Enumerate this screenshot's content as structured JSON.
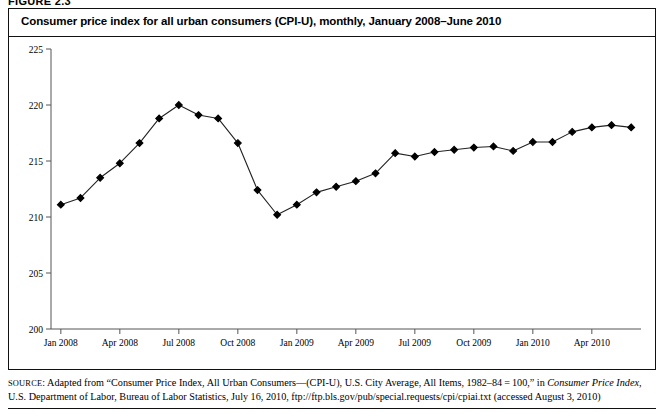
{
  "figure": {
    "label": "FIGURE 2.3"
  },
  "title": "Consumer price index for all urban consumers (CPI-U), monthly, January 2008–June 2010",
  "source": {
    "prefix": "SOURCE",
    "line1_a": ": Adapted from “Consumer Price Index, All Urban Consumers—(CPI-U), U.S. City Average, All Items, 1982–84 = 100,” in ",
    "line1_em": "Consumer Price Index,",
    "line2": "U.S. Department of Labor, Bureau of Labor Statistics, July 16, 2010, ftp://ftp.bls.gov/pub/special.requests/cpi/cpiai.txt (accessed August 3, 2010)"
  },
  "colors": {
    "line": "#222222",
    "marker": "#000000",
    "axis": "#555555",
    "frame": "#111111",
    "background": "#ffffff"
  },
  "chart_data": {
    "type": "line",
    "title": "Consumer price index for all urban consumers (CPI-U), monthly, January 2008–June 2010",
    "xlabel": "",
    "ylabel": "",
    "ylim": [
      200,
      225
    ],
    "yticks": [
      200,
      205,
      210,
      215,
      220,
      225
    ],
    "ytick_labels": [
      "200",
      "205",
      "210",
      "215",
      "220",
      "225"
    ],
    "xtick_labels": [
      "Jan 2008",
      "Apr 2008",
      "Jul 2008",
      "Oct 2008",
      "Jan 2009",
      "Apr 2009",
      "Jul 2009",
      "Oct 2009",
      "Jan 2010",
      "Apr 2010"
    ],
    "xtick_indices": [
      0,
      3,
      6,
      9,
      12,
      15,
      18,
      21,
      24,
      27
    ],
    "grid": false,
    "legend": null,
    "markers": "diamond",
    "x": [
      "Jan 2008",
      "Feb 2008",
      "Mar 2008",
      "Apr 2008",
      "May 2008",
      "Jun 2008",
      "Jul 2008",
      "Aug 2008",
      "Sep 2008",
      "Oct 2008",
      "Nov 2008",
      "Dec 2008",
      "Jan 2009",
      "Feb 2009",
      "Mar 2009",
      "Apr 2009",
      "May 2009",
      "Jun 2009",
      "Jul 2009",
      "Aug 2009",
      "Sep 2009",
      "Oct 2009",
      "Nov 2009",
      "Dec 2009",
      "Jan 2010",
      "Feb 2010",
      "Mar 2010",
      "Apr 2010",
      "May 2010",
      "Jun 2010"
    ],
    "values": [
      211.1,
      211.7,
      213.5,
      214.8,
      216.6,
      218.8,
      220.0,
      219.1,
      218.8,
      216.6,
      212.4,
      210.2,
      211.1,
      212.2,
      212.7,
      213.2,
      213.9,
      215.7,
      215.4,
      215.8,
      216.0,
      216.2,
      216.3,
      215.9,
      216.7,
      216.7,
      217.6,
      218.0,
      218.2,
      218.0
    ],
    "series_name": "CPI-U"
  }
}
